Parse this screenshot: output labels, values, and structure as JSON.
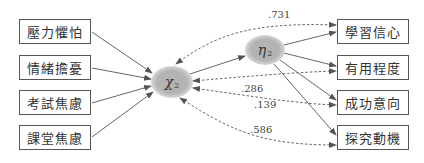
{
  "diagram": {
    "type": "structural-equation-model",
    "exogenous_indicators": [
      {
        "id": "x1",
        "label": "壓力懼怕"
      },
      {
        "id": "x2",
        "label": "情緒擔憂"
      },
      {
        "id": "x3",
        "label": "考試焦慮"
      },
      {
        "id": "x4",
        "label": "課堂焦慮"
      }
    ],
    "latent_variables": [
      {
        "id": "chi2",
        "symbol": "χ",
        "subscript": "2"
      },
      {
        "id": "eta2",
        "symbol": "η",
        "subscript": "2"
      }
    ],
    "endogenous_indicators": [
      {
        "id": "y1",
        "label": "學習信心"
      },
      {
        "id": "y2",
        "label": "有用程度"
      },
      {
        "id": "y3",
        "label": "成功意向"
      },
      {
        "id": "y4",
        "label": "探究動機"
      }
    ],
    "coefficients": [
      {
        "from": "chi2",
        "to": "y1",
        "value": ".731",
        "style": "dashed"
      },
      {
        "from": "chi2",
        "to": "y2",
        "value": ".286",
        "style": "dashed"
      },
      {
        "from": "chi2",
        "to": "y3",
        "value": ".139",
        "style": "dashed"
      },
      {
        "from": "chi2",
        "to": "y4",
        "value": ".586",
        "style": "dashed"
      }
    ],
    "colors": {
      "latent_fill": "#b3b3b3",
      "line": "#666666",
      "box_border": "#555555"
    }
  }
}
